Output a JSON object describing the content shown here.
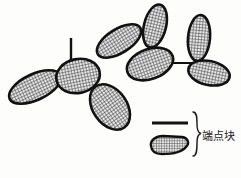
{
  "figure": {
    "title": "",
    "background_color": "#fdfdfb",
    "stroke_color": "#111111",
    "hatch_color": "#2b2b2b",
    "hatch_fill_color": "#d8d8d8",
    "blobs": [
      {
        "name": "blob-left-outer",
        "cx": 35,
        "cy": 87,
        "rx": 28,
        "ry": 13,
        "rotation": -25
      },
      {
        "name": "blob-left-upper",
        "cx": 78,
        "cy": 76,
        "rx": 22,
        "ry": 17,
        "rotation": -12
      },
      {
        "name": "blob-lower-middle",
        "cx": 110,
        "cy": 107,
        "rx": 25,
        "ry": 17,
        "rotation": 55
      },
      {
        "name": "blob-upper-left-petal",
        "cx": 119,
        "cy": 41,
        "rx": 25,
        "ry": 12,
        "rotation": -32
      },
      {
        "name": "blob-top-petal",
        "cx": 155,
        "cy": 26,
        "rx": 11,
        "ry": 22,
        "rotation": 14
      },
      {
        "name": "blob-center",
        "cx": 150,
        "cy": 64,
        "rx": 24,
        "ry": 15,
        "rotation": -20
      },
      {
        "name": "blob-right-vertical",
        "cx": 199,
        "cy": 38,
        "rx": 11,
        "ry": 23,
        "rotation": 5
      },
      {
        "name": "blob-right-lower",
        "cx": 209,
        "cy": 73,
        "rx": 21,
        "ry": 12,
        "rotation": 12
      }
    ],
    "connectors": [
      {
        "name": "stem-vertical-left",
        "x1": 71,
        "y1": 38,
        "x2": 71,
        "y2": 66,
        "width": 2.4
      },
      {
        "name": "link-center-to-right",
        "x1": 164,
        "y1": 63,
        "x2": 194,
        "y2": 63,
        "width": 2.0
      }
    ]
  },
  "legend": {
    "name": "endpoint-block-legend",
    "label": "端点块",
    "sample_line": {
      "x1": 152,
      "y1": 123,
      "x2": 188,
      "y2": 123,
      "width": 3.2
    },
    "sample_blob": {
      "name": "legend-blob",
      "cx": 169,
      "cy": 145,
      "rx": 21,
      "ry": 10
    },
    "brace_color": "#1a1a1a"
  }
}
